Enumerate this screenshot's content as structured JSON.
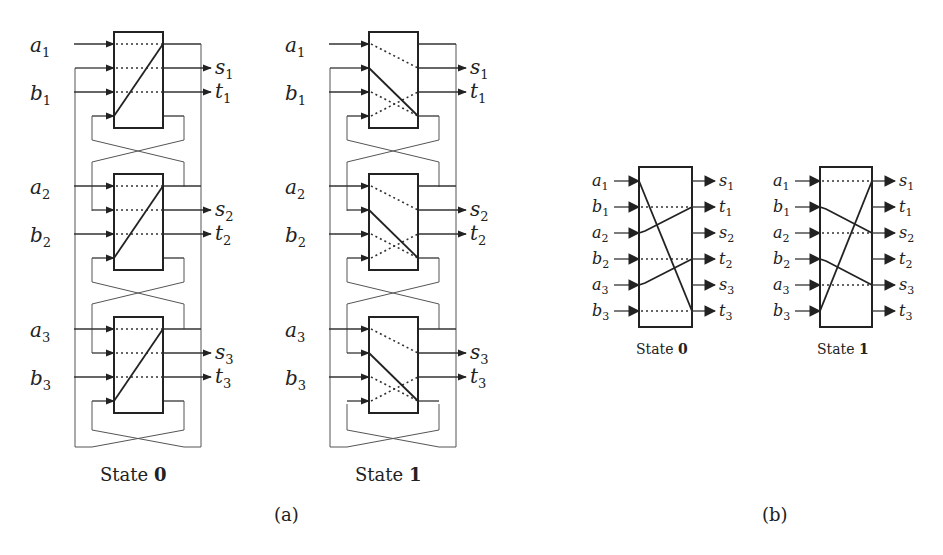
{
  "figure": {
    "part_a": {
      "label": "(a)",
      "diagrams": [
        {
          "caption_prefix": "State ",
          "caption_state": "0",
          "blocks": [
            {
              "inputs": [
                "a1",
                "b1"
              ],
              "outputs": [
                "s1",
                "t1"
              ]
            },
            {
              "inputs": [
                "a2",
                "b2"
              ],
              "outputs": [
                "s2",
                "t2"
              ]
            },
            {
              "inputs": [
                "a3",
                "b3"
              ],
              "outputs": [
                "s3",
                "t3"
              ]
            }
          ]
        },
        {
          "caption_prefix": "State ",
          "caption_state": "1",
          "blocks": [
            {
              "inputs": [
                "a1",
                "b1"
              ],
              "outputs": [
                "s1",
                "t1"
              ]
            },
            {
              "inputs": [
                "a2",
                "b2"
              ],
              "outputs": [
                "s2",
                "t2"
              ]
            },
            {
              "inputs": [
                "a3",
                "b3"
              ],
              "outputs": [
                "s3",
                "t3"
              ]
            }
          ]
        }
      ]
    },
    "part_b": {
      "label": "(b)",
      "diagrams": [
        {
          "caption_prefix": "State ",
          "caption_state": "0",
          "inputs": [
            "a1",
            "b1",
            "a2",
            "b2",
            "a3",
            "b3"
          ],
          "outputs": [
            "s1",
            "t1",
            "s2",
            "t2",
            "s3",
            "t3"
          ]
        },
        {
          "caption_prefix": "State ",
          "caption_state": "1",
          "inputs": [
            "a1",
            "b1",
            "a2",
            "b2",
            "a3",
            "b3"
          ],
          "outputs": [
            "s1",
            "t1",
            "s2",
            "t2",
            "s3",
            "t3"
          ]
        }
      ]
    },
    "labels": {
      "a": "a",
      "b": "b",
      "s": "s",
      "t": "t",
      "n1": "1",
      "n2": "2",
      "n3": "3"
    }
  }
}
